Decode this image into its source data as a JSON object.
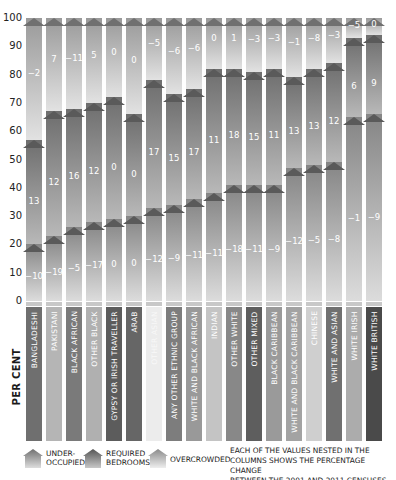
{
  "chart_data": {
    "type": "bar",
    "stacked": true,
    "title": "",
    "xlabel": "",
    "ylabel": "PER CENT",
    "ylim": [
      0,
      100
    ],
    "yticks": [
      0,
      10,
      20,
      30,
      40,
      50,
      60,
      70,
      80,
      90,
      100
    ],
    "categories": [
      "BANGLADESHI",
      "PAKISTANI",
      "BLACK AFRICAN",
      "OTHER BLACK",
      "GYPSY OR IRISH TRAVELLER",
      "ARAB",
      "OTHER ASIAN",
      "ANY OTHER ETHNIC GROUP",
      "WHITE AND BLACK AFRICAN",
      "INDIAN",
      "OTHER WHITE",
      "OTHER MIXED",
      "BLACK CARIBBEAN",
      "WHITE AND BLACK CARIBBEAN",
      "CHINESE",
      "WHITE AND ASIAN",
      "WHITE IRISH",
      "WHITE BRITISH"
    ],
    "category_colors": [
      "#6f6f6f",
      "#b5b5b5",
      "#7a7a7a",
      "#b0b0b0",
      "#5c5c5c",
      "#666666",
      "#ececec",
      "#7d7d7d",
      "#999999",
      "#c4c4c4",
      "#888888",
      "#5e5e5e",
      "#9a9a9a",
      "#a3a3a3",
      "#cfcfcf",
      "#707070",
      "#acacac",
      "#4a4a4a"
    ],
    "series": [
      {
        "name": "UNDER-OCCUPIED",
        "values": [
          20,
          23,
          26,
          28,
          29,
          30,
          33,
          34,
          36,
          38,
          41,
          41,
          41,
          47,
          48,
          49,
          65,
          66
        ]
      },
      {
        "name": "REQUIRED BEDROOMS",
        "values": [
          37,
          44,
          42,
          42,
          43,
          36,
          45,
          39,
          39,
          44,
          41,
          40,
          41,
          32,
          34,
          35,
          28,
          28
        ]
      },
      {
        "name": "OVERCROWDED",
        "values": [
          43,
          33,
          32,
          30,
          28,
          34,
          22,
          27,
          25,
          18,
          18,
          19,
          18,
          21,
          18,
          16,
          7,
          6
        ]
      }
    ],
    "change_2001_2011": {
      "under_occupied": [
        -10,
        -19,
        -5,
        -17,
        0,
        0,
        -12,
        -9,
        -11,
        -11,
        -18,
        -11,
        -9,
        -12,
        -5,
        -8,
        -1,
        -9
      ],
      "required_bedrooms": [
        13,
        12,
        16,
        12,
        0,
        0,
        17,
        15,
        17,
        11,
        18,
        15,
        11,
        13,
        13,
        12,
        6,
        9
      ],
      "overcrowded": [
        -2,
        7,
        -11,
        5,
        0,
        0,
        -5,
        -6,
        -6,
        0,
        1,
        -3,
        -3,
        -1,
        -8,
        -3,
        -5,
        0
      ]
    },
    "legend_position": "bottom",
    "grid": false
  },
  "legend": {
    "items": [
      {
        "label_line1": "UNDER-",
        "label_line2": "OCCUPIED",
        "color": "#7a7a7a"
      },
      {
        "label_line1": "REQUIRED",
        "label_line2": "BEDROOMS",
        "color": "#6a6a6a"
      },
      {
        "label_line1": "OVERCROWDED",
        "label_line2": "",
        "color": "#9e9e9e"
      }
    ],
    "note_line1": "EACH OF THE VALUES NESTED IN THE",
    "note_line2": "COLUMNS SHOWS THE PERCENTAGE CHANGE",
    "note_line3": "BETWEEN THE 2001 AND 2011 CENSUSES"
  },
  "colors": {
    "roof": "#5a5a5a",
    "text_on_bar": "#ffffff",
    "axis_text": "#222222"
  }
}
